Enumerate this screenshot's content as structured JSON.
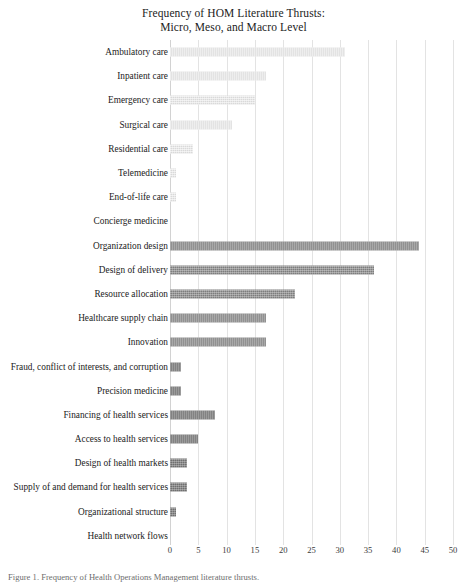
{
  "chart_data": {
    "type": "bar",
    "orientation": "horizontal",
    "title": "Frequency of HOM Literature Thrusts:",
    "subtitle": "Micro, Meso, and Macro Level",
    "xlabel": "",
    "ylabel": "",
    "xlim": [
      0,
      50
    ],
    "xticks": [
      "0",
      "5",
      "10",
      "15",
      "20",
      "25",
      "30",
      "35",
      "40",
      "45",
      "50"
    ],
    "grid": true,
    "legend": "none",
    "categories": [
      "Ambulatory care",
      "Inpatient care",
      "Emergency care",
      "Surgical care",
      "Residential care",
      "Telemedicine",
      "End-of-life care",
      "Concierge medicine",
      "Organization design",
      "Design of delivery",
      "Resource allocation",
      "Healthcare supply chain",
      "Innovation",
      "Fraud, conflict of interests, and corruption",
      "Precision medicine",
      "Financing of health services",
      "Access to health services",
      "Design of health markets",
      "Supply of and demand for health services",
      "Organizational structure",
      "Health network flows"
    ],
    "values": [
      31,
      17,
      15,
      11,
      4,
      1,
      1,
      0,
      44,
      36,
      22,
      17,
      17,
      2,
      2,
      8,
      5,
      3,
      3,
      1,
      0
    ],
    "groups": [
      "micro",
      "micro",
      "micro",
      "micro",
      "micro",
      "micro",
      "micro",
      "micro",
      "meso",
      "meso",
      "meso",
      "meso",
      "meso",
      "macro",
      "macro",
      "macro",
      "macro",
      "macro",
      "macro",
      "macro",
      "macro"
    ],
    "group_colors": {
      "micro": "#d9d9d9",
      "meso": "#7d7d7d",
      "macro": "#6f6f6f"
    }
  },
  "caption": "Figure 1. Frequency of Health Operations Management literature thrusts."
}
